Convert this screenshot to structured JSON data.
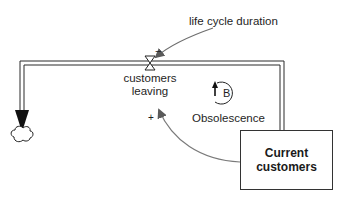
{
  "diagram": {
    "type": "stock-and-flow",
    "stock": {
      "label_line1": "Current",
      "label_line2": "customers"
    },
    "flow": {
      "label_line1": "customers",
      "label_line2": "leaving"
    },
    "auxiliary": {
      "label": "life cycle duration"
    },
    "loop": {
      "letter": "B",
      "name": "Obsolescence"
    },
    "polarities": {
      "duration_to_flow": "−",
      "stock_to_flow": "+"
    },
    "icons": {
      "sink": "cloud-icon",
      "valve": "valve-icon",
      "loop": "balancing-loop-icon"
    },
    "colors": {
      "line": "#2b2b2b",
      "arrow": "#6e6e6e",
      "pipe": "#2b2b2b"
    }
  }
}
